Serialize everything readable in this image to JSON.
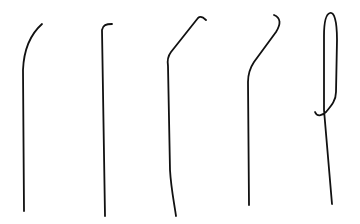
{
  "canvas": {
    "width": 360,
    "height": 224,
    "background": "#ffffff",
    "stroke_color": "#111111",
    "stroke_width": 1.8
  },
  "strokes": [
    {
      "name": "stroke-1-curved-left",
      "d": "M42,24 C33,32 24,45 23,70 L24,211"
    },
    {
      "name": "stroke-2-small-hook",
      "d": "M112,24 C106,24 103,25 102,30 L105,216"
    },
    {
      "name": "stroke-3-angled-hook",
      "d": "M206,20 C203,17 200,16 198,18 L171,52 C168,56 167,60 168,66 L170,170 C171,188 174,202 176,216"
    },
    {
      "name": "stroke-4-s-hook",
      "d": "M274,15 C281,18 281,24 276,32 L254,62 C250,68 248,74 248,82 L249,205"
    },
    {
      "name": "stroke-5-loop",
      "d": "M315,112 C317,117 322,116 326,112 C332,105 336,100 336,92 L337,40 C337,20 334,12 330,13 C326,14 324,22 324,36 L324,110 L332,204"
    }
  ]
}
